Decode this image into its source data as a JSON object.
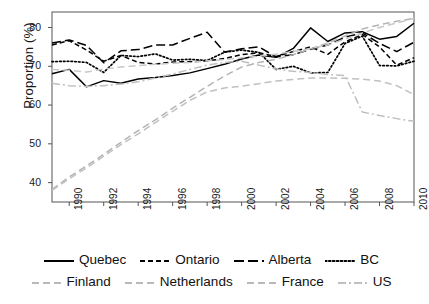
{
  "chart_data": {
    "type": "line",
    "title": "",
    "xlabel": "",
    "ylabel": "Proportion (%)",
    "xlim": [
      1989,
      2010
    ],
    "ylim": [
      35,
      84
    ],
    "grid": false,
    "legend_position": "bottom",
    "x": [
      1989,
      1990,
      1991,
      1992,
      1993,
      1994,
      1995,
      1996,
      1997,
      1998,
      1999,
      2000,
      2001,
      2002,
      2003,
      2004,
      2005,
      2006,
      2007,
      2008,
      2009,
      2010
    ],
    "xticks": [
      "1990",
      "1992",
      "1994",
      "1996",
      "1998",
      "2000",
      "2002",
      "2004",
      "2006",
      "2008",
      "2010"
    ],
    "xtick_values": [
      1990,
      1992,
      1994,
      1996,
      1998,
      2000,
      2002,
      2004,
      2006,
      2008,
      2010
    ],
    "yticks": [
      "40",
      "50",
      "60",
      "70",
      "80"
    ],
    "ytick_values": [
      40,
      50,
      60,
      70,
      80
    ],
    "series": [
      {
        "name": "Quebec",
        "style": "solid",
        "color": "#000000",
        "values": [
          68.1,
          69.2,
          64.7,
          66.3,
          65.6,
          66.7,
          67.1,
          67.6,
          68.3,
          69.4,
          70.5,
          71.9,
          72.9,
          72.3,
          74.6,
          79.9,
          76.4,
          78.6,
          78.9,
          77.0,
          77.7,
          81.1
        ]
      },
      {
        "name": "Ontario",
        "style": "dashed",
        "color": "#000000",
        "values": [
          75.5,
          76.6,
          74.2,
          71.3,
          72.8,
          71.0,
          70.6,
          71.1,
          71.2,
          71.4,
          72.0,
          73.0,
          73.5,
          72.5,
          73.8,
          75.0,
          73.1,
          76.3,
          78.2,
          75.0,
          70.3,
          72.2
        ]
      },
      {
        "name": "Alberta",
        "style": "longdash",
        "color": "#000000",
        "values": [
          76.0,
          76.8,
          75.4,
          70.9,
          74.0,
          74.3,
          75.5,
          75.5,
          77.2,
          78.8,
          73.7,
          74.5,
          75.0,
          72.4,
          73.0,
          74.4,
          75.5,
          77.5,
          78.6,
          75.9,
          73.8,
          76.2
        ]
      },
      {
        "name": "BC",
        "style": "dotted",
        "color": "#000000",
        "values": [
          71.2,
          71.3,
          71.0,
          68.4,
          72.8,
          72.5,
          73.2,
          71.6,
          71.8,
          71.5,
          73.6,
          74.2,
          73.6,
          69.2,
          70.0,
          68.3,
          68.4,
          75.9,
          77.8,
          70.2,
          70.1,
          71.3
        ]
      },
      {
        "name": "Finland",
        "style": "dashed-gray",
        "color": "#b4b4b4",
        "values": [
          38.2,
          41.5,
          44.3,
          47.3,
          50.4,
          53.4,
          56.2,
          59.2,
          62.0,
          64.8,
          67.5,
          69.8,
          71.0,
          71.8,
          73.0,
          74.5,
          76.0,
          77.8,
          79.6,
          80.7,
          81.6,
          82.4
        ]
      },
      {
        "name": "Netherlands",
        "style": "dashed-gray",
        "color": "#c0c0c0",
        "values": [
          38.0,
          41.0,
          43.8,
          46.8,
          49.8,
          52.6,
          55.5,
          58.4,
          61.2,
          63.4,
          64.4,
          64.9,
          65.5,
          66.2,
          66.6,
          67.0,
          67.0,
          66.9,
          66.7,
          66.2,
          65.0,
          62.7
        ]
      },
      {
        "name": "France",
        "style": "dashed-gray",
        "color": "#c8c8c8",
        "values": [
          69.2,
          69.0,
          68.5,
          69.3,
          69.8,
          70.2,
          70.5,
          70.8,
          71.0,
          71.4,
          71.7,
          72.2,
          72.6,
          73.1,
          73.8,
          74.6,
          75.5,
          77.0,
          78.6,
          80.0,
          81.2,
          82.3
        ]
      },
      {
        "name": "US",
        "style": "dashdot-gray",
        "color": "#bfbfbf",
        "values": [
          65.6,
          65.0,
          64.8,
          65.0,
          65.4,
          66.0,
          67.0,
          68.0,
          69.2,
          70.3,
          71.0,
          71.3,
          70.3,
          69.3,
          68.7,
          68.4,
          67.9,
          67.6,
          58.2,
          57.3,
          56.5,
          55.8
        ]
      }
    ]
  },
  "legend": {
    "rows": [
      [
        {
          "label": "Quebec",
          "key": "solid-black"
        },
        {
          "label": "Ontario",
          "key": "dashed-black"
        },
        {
          "label": "Alberta",
          "key": "longdash-black"
        },
        {
          "label": "BC",
          "key": "dotted-black"
        }
      ],
      [
        {
          "label": "Finland",
          "key": "dashed-gray"
        },
        {
          "label": "Netherlands",
          "key": "dashed-gray"
        },
        {
          "label": "France",
          "key": "dashed-gray"
        },
        {
          "label": "US",
          "key": "dashdot-gray"
        }
      ]
    ]
  },
  "axes": {
    "y_axis_label": "Proportion (%)"
  }
}
